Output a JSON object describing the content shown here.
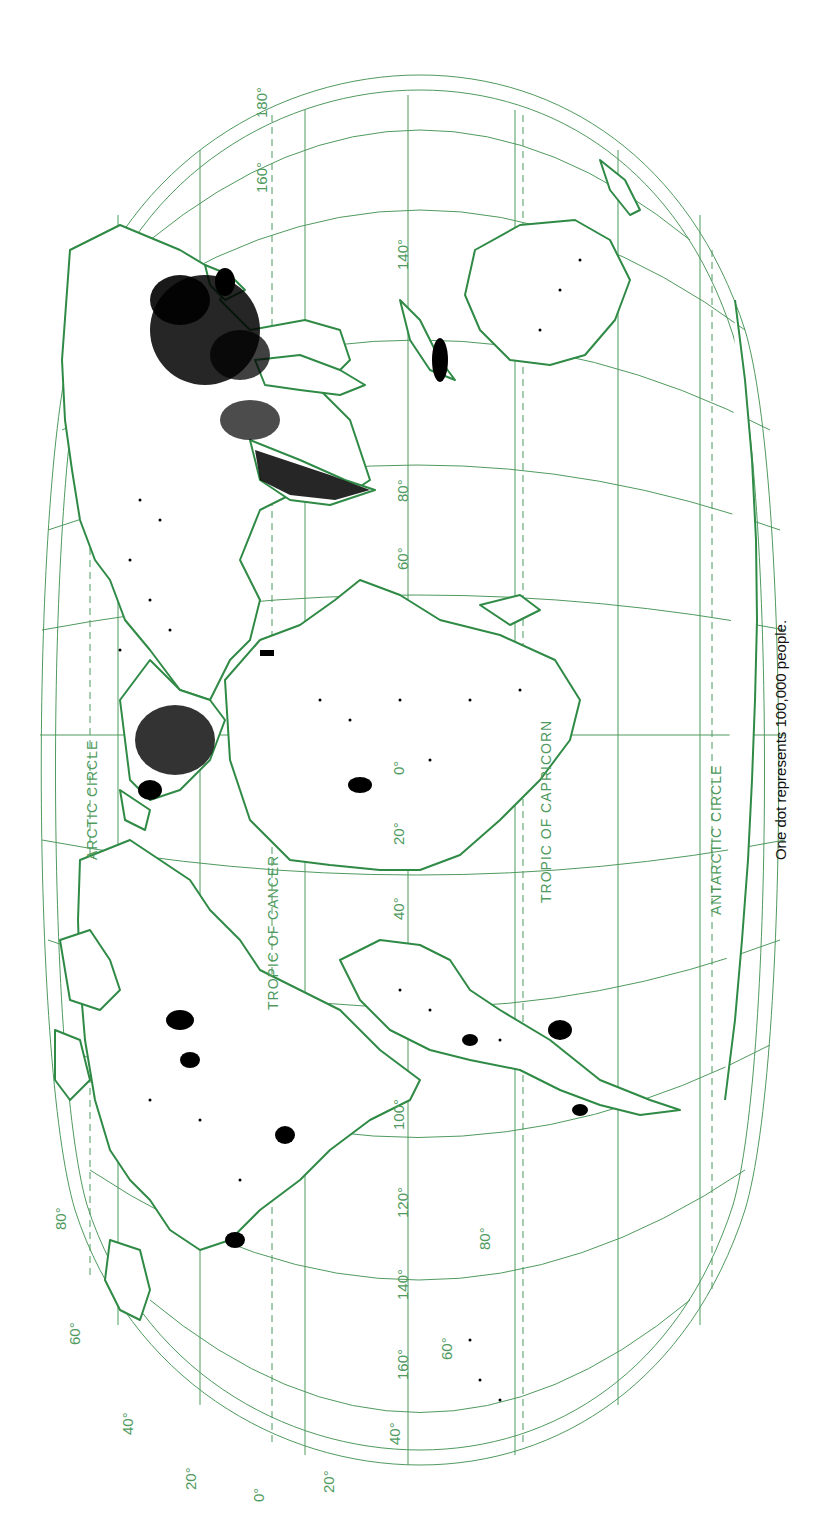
{
  "map": {
    "title": "World population distribution (dot map)",
    "orientation": "rotated 90° clockwise — north on the left",
    "colors": {
      "graticule": "#4f9a5e",
      "coastline": "#2f8a45",
      "dots": "#000000",
      "background": "#ffffff"
    },
    "parallels": {
      "labels": [
        "TROPIC OF CANCER",
        "TROPIC OF CAPRICORN",
        "ARCTIC CIRCLE",
        "ANTARCTIC CIRCLE"
      ],
      "tropic_of_cancer": "TROPIC OF CANCER",
      "tropic_of_capricorn": "TROPIC OF CAPRICORN",
      "arctic_circle": "ARCTIC CIRCLE",
      "antarctic_circle": "ANTARCTIC CIRCLE"
    },
    "longitude_labels": {
      "top": [
        "180°",
        "160°",
        "140°"
      ],
      "middle": [
        "80°",
        "60°",
        "40°",
        "20°",
        "0°",
        "20°",
        "40°",
        "100°"
      ],
      "bottom": [
        "120°",
        "140°",
        "160°",
        "0°"
      ]
    },
    "latitude_labels": {
      "bottom_left_edge": [
        "80°",
        "60°",
        "40°",
        "20°",
        "0°"
      ],
      "bottom_right_edge": [
        "20°",
        "40°",
        "60°",
        "80°"
      ]
    },
    "caption": "One dot represents 100,000 people."
  },
  "labels": {
    "lon180": "180°",
    "lon160_top": "160°",
    "lon140_top": "140°",
    "lon80": "80°",
    "lon60": "60°",
    "lon40e": "40°",
    "lon20e": "20°",
    "lon0_mid": "0°",
    "lon20w": "20°",
    "lon40w": "40°",
    "lon100": "100°",
    "lon120": "120°",
    "lon140_bot": "140°",
    "lon160_bot": "160°",
    "lat80n": "80°",
    "lat60n": "60°",
    "lat40n": "40°",
    "lat20n": "20°",
    "lat0": "0°",
    "lat20s": "20°",
    "lat40s": "40°",
    "lat60s": "60°",
    "lat80s": "80°",
    "cancer": "TROPIC OF CANCER",
    "capricorn": "TROPIC OF CAPRICORN",
    "arctic": "ARCTIC CIRCLE",
    "antarctic": "ANTARCTIC CIRCLE"
  }
}
